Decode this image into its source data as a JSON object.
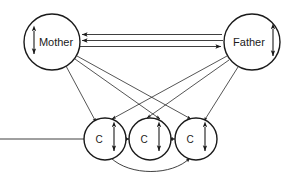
{
  "diagram": {
    "background_color": "#ffffff",
    "stroke_color": "#1a1a1a",
    "nodes": [
      {
        "id": "mother",
        "label": "Mother",
        "role": "parent",
        "cx": 52,
        "cy": 42,
        "r": 28,
        "self_arrow": {
          "side": "left",
          "type": "double-headed-vertical"
        }
      },
      {
        "id": "father",
        "label": "Father",
        "role": "parent",
        "cx": 252,
        "cy": 42,
        "r": 28,
        "self_arrow": {
          "side": "right",
          "type": "double-headed-vertical"
        }
      },
      {
        "id": "child-left",
        "label": "C",
        "role": "child",
        "cx": 105,
        "cy": 139,
        "r": 21,
        "self_arrow": {
          "side": "right",
          "type": "double-headed-vertical"
        }
      },
      {
        "id": "child-middle",
        "label": "C",
        "role": "child",
        "cx": 150,
        "cy": 139,
        "r": 21,
        "self_arrow": {
          "side": "right",
          "type": "double-headed-vertical"
        }
      },
      {
        "id": "child-right",
        "label": "C",
        "role": "child",
        "cx": 196,
        "cy": 139,
        "r": 21,
        "self_arrow": {
          "side": "right",
          "type": "double-headed-vertical"
        }
      }
    ],
    "edges": [
      {
        "id": "mother-father-top",
        "from": "father",
        "to": "mother",
        "style": "straight",
        "direction": "to-mother"
      },
      {
        "id": "mother-father-mid",
        "from": "father",
        "to": "mother",
        "style": "straight",
        "direction": "to-mother"
      },
      {
        "id": "mother-father-bottom",
        "from": "mother",
        "to": "father",
        "style": "straight",
        "direction": "to-father"
      },
      {
        "id": "mother-child-left",
        "from": "mother",
        "to": "child-left",
        "style": "straight",
        "direction": "to-child"
      },
      {
        "id": "mother-child-middle",
        "from": "mother",
        "to": "child-middle",
        "style": "straight",
        "direction": "to-child"
      },
      {
        "id": "mother-child-right",
        "from": "mother",
        "to": "child-right",
        "style": "straight",
        "direction": "to-child"
      },
      {
        "id": "father-child-left",
        "from": "father",
        "to": "child-left",
        "style": "straight",
        "direction": "to-child"
      },
      {
        "id": "father-child-middle",
        "from": "father",
        "to": "child-middle",
        "style": "straight",
        "direction": "to-child"
      },
      {
        "id": "father-child-right",
        "from": "father",
        "to": "child-right",
        "style": "straight",
        "direction": "to-child"
      },
      {
        "id": "child-left-middle",
        "from": "child-left",
        "to": "child-middle",
        "style": "straight",
        "direction": "bidirectional"
      },
      {
        "id": "child-middle-right",
        "from": "child-middle",
        "to": "child-right",
        "style": "straight",
        "direction": "bidirectional"
      },
      {
        "id": "child-left-right",
        "from": "child-left",
        "to": "child-right",
        "style": "curved-below",
        "direction": "bidirectional"
      }
    ]
  }
}
